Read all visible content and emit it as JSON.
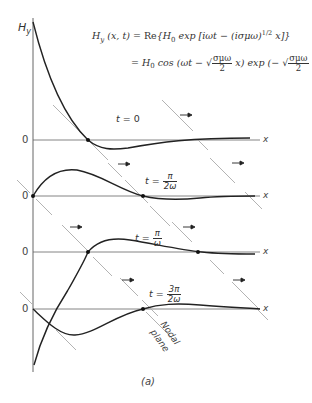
{
  "figure": {
    "caption": "(a)",
    "y_axis_label": "H",
    "y_axis_sub": "y",
    "x_axis_label": "x",
    "zero_label": "0",
    "equation": {
      "line1_lhs": "H",
      "line1_lhs_sub": "y",
      "line1_args": " (x, t) = ",
      "line1_re": "Re",
      "line1_body": "{H",
      "line1_body_sub": "0",
      "line1_exp": " exp [iωt − (iσμω)",
      "line1_power": "1/2",
      "line1_tail": " x]}",
      "line2_eq": "= H",
      "line2_sub": "0",
      "line2_cos": " cos (ωt − ",
      "line2_sqrt_num": "σμω",
      "line2_sqrt_den": "2",
      "line2_mid": " x)  exp (− ",
      "line2_tail": " x)"
    },
    "panels": [
      {
        "time_label_pre": "t = ",
        "time_label": "0",
        "fraction": false
      },
      {
        "time_label_pre": "t = ",
        "num": "π",
        "den": "2ω",
        "fraction": true
      },
      {
        "time_label_pre": "t = ",
        "num": "π",
        "den": "ω",
        "fraction": true
      },
      {
        "time_label_pre": "t = ",
        "num": "3π",
        "den": "2ω",
        "fraction": true
      }
    ],
    "annotation": {
      "line1": "Nodal",
      "line2": "plane"
    },
    "arrow_glyph": "→"
  }
}
